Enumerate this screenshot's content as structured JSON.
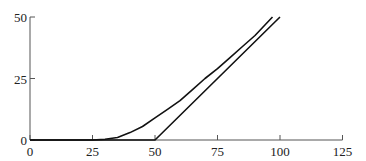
{
  "chart_data": {
    "type": "line",
    "title": "",
    "xlabel": "",
    "ylabel": "",
    "xlim": [
      0,
      125
    ],
    "ylim": [
      0,
      50
    ],
    "grid": false,
    "x_ticks": [
      "0",
      "25",
      "50",
      "75",
      "100",
      "125"
    ],
    "y_ticks": [
      "0",
      "25",
      "50"
    ],
    "series": [
      {
        "name": "curve",
        "x": [
          0,
          25,
          30,
          35,
          40,
          45,
          50,
          55,
          60,
          65,
          70,
          75,
          80,
          85,
          90,
          97
        ],
        "y": [
          0,
          0,
          0.3,
          1.0,
          3.0,
          5.5,
          9.0,
          12.5,
          16.0,
          20.5,
          25.0,
          29.0,
          33.5,
          38.0,
          42.5,
          50.0
        ]
      },
      {
        "name": "line",
        "x": [
          0,
          50,
          100
        ],
        "y": [
          0,
          0,
          50
        ]
      }
    ]
  }
}
